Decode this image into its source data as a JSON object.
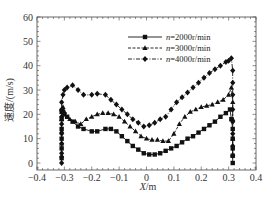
{
  "chart_data": {
    "type": "line",
    "title": "",
    "xlabel": "X/m",
    "ylabel": "速度/(m/s)",
    "xlim": [
      -0.4,
      0.4
    ],
    "ylim": [
      -3,
      60
    ],
    "xticks": [
      -0.4,
      -0.3,
      -0.2,
      -0.1,
      0,
      0.1,
      0.2,
      0.3,
      0.4
    ],
    "xtick_labels": [
      "-0.4",
      "-0.3",
      "-0.2",
      "-0.1",
      "0",
      "0.1",
      "0.2",
      "0.3",
      "0.4"
    ],
    "yticks": [
      0,
      10,
      20,
      30,
      40,
      50,
      60
    ],
    "ytick_labels": [
      "0",
      "10",
      "20",
      "30",
      "40",
      "50",
      "60"
    ],
    "grid": false,
    "legend_position": "upper right",
    "series": [
      {
        "name": "n=2000r/min",
        "marker": "square",
        "linestyle": "solid",
        "x": [
          -0.31,
          -0.31,
          -0.31,
          -0.31,
          -0.31,
          -0.31,
          -0.305,
          -0.3,
          -0.29,
          -0.27,
          -0.25,
          -0.23,
          -0.2,
          -0.18,
          -0.15,
          -0.13,
          -0.11,
          -0.09,
          -0.07,
          -0.05,
          -0.03,
          -0.01,
          0.01,
          0.03,
          0.05,
          0.07,
          0.09,
          0.11,
          0.13,
          0.15,
          0.17,
          0.19,
          0.21,
          0.23,
          0.25,
          0.27,
          0.29,
          0.305,
          0.31,
          0.315,
          0.315,
          0.315,
          0.315,
          0.315
        ],
        "y": [
          2,
          6,
          10,
          14,
          18,
          21,
          21,
          20,
          19,
          17,
          15,
          14,
          13,
          13,
          14,
          14,
          13,
          11,
          9,
          7,
          5.5,
          4,
          3.5,
          3.5,
          4,
          5,
          6,
          7,
          8.5,
          10,
          11,
          12.5,
          14,
          15.5,
          17,
          19,
          20.5,
          22,
          18,
          14,
          10,
          6,
          3,
          0
        ]
      },
      {
        "name": "n=3000r/min",
        "marker": "triangle",
        "linestyle": "dashed",
        "x": [
          -0.31,
          -0.31,
          -0.31,
          -0.31,
          -0.31,
          -0.305,
          -0.3,
          -0.28,
          -0.26,
          -0.24,
          -0.22,
          -0.2,
          -0.18,
          -0.16,
          -0.14,
          -0.12,
          -0.1,
          -0.08,
          -0.06,
          -0.04,
          -0.02,
          0,
          0.02,
          0.04,
          0.06,
          0.08,
          0.1,
          0.12,
          0.14,
          0.16,
          0.18,
          0.2,
          0.22,
          0.24,
          0.26,
          0.28,
          0.3,
          0.31,
          0.315,
          0.315,
          0.315,
          0.315
        ],
        "y": [
          3,
          8,
          13,
          18,
          22,
          23,
          21,
          18,
          17,
          16,
          18,
          19,
          20,
          20.5,
          20.5,
          20,
          19,
          17,
          15,
          13,
          11,
          10,
          9.5,
          9.5,
          9,
          9,
          12,
          16,
          19,
          21,
          22,
          23,
          23.5,
          24,
          25,
          26,
          28,
          31,
          25,
          18,
          10,
          3
        ]
      },
      {
        "name": "n=4000r/min",
        "marker": "diamond",
        "linestyle": "dashdot",
        "x": [
          -0.31,
          -0.31,
          -0.31,
          -0.31,
          -0.31,
          -0.31,
          -0.31,
          -0.31,
          -0.305,
          -0.3,
          -0.29,
          -0.27,
          -0.25,
          -0.23,
          -0.2,
          -0.18,
          -0.15,
          -0.13,
          -0.11,
          -0.09,
          -0.07,
          -0.05,
          -0.03,
          -0.01,
          0.01,
          0.03,
          0.05,
          0.07,
          0.09,
          0.11,
          0.13,
          0.15,
          0.17,
          0.19,
          0.21,
          0.23,
          0.25,
          0.27,
          0.29,
          0.3,
          0.31,
          0.315,
          0.315,
          0.315,
          0.315,
          0.315,
          0.315,
          0.315,
          0.315
        ],
        "y": [
          0,
          4,
          8,
          12,
          16,
          19,
          22,
          25,
          28,
          30,
          31,
          32,
          30,
          28,
          28,
          28.5,
          28,
          26,
          24,
          22,
          20,
          18,
          16.5,
          15,
          15.5,
          16.5,
          18,
          19,
          22,
          25,
          27,
          29,
          31,
          33,
          35,
          37,
          38.5,
          40,
          41.5,
          42,
          43,
          38,
          33,
          28,
          22,
          17,
          12,
          7,
          3
        ]
      }
    ]
  },
  "legend": {
    "items": [
      {
        "label_n": "n",
        "label_rest": "=2000r/min"
      },
      {
        "label_n": "n",
        "label_rest": "=3000r/min"
      },
      {
        "label_n": "n",
        "label_rest": "=4000r/min"
      }
    ]
  },
  "axes": {
    "xlabel_var": "X",
    "xlabel_unit": "/m",
    "ylabel": "速度/(m/s)"
  }
}
